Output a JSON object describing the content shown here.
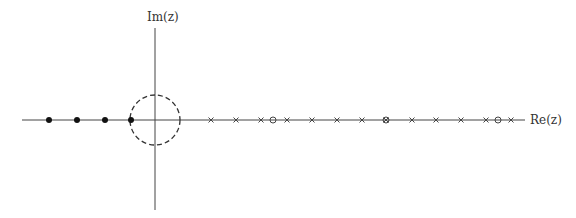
{
  "diagram": {
    "axes": {
      "x_label": "Re(z)",
      "y_label": "Im(z)",
      "origin_px": [
        155,
        120
      ],
      "x_range_px": [
        22,
        525
      ],
      "y_range_px": [
        28,
        210
      ],
      "color": "#444444"
    },
    "unit_circle": {
      "center_px": [
        155,
        120
      ],
      "radius_px": 25,
      "style": "dashed"
    },
    "filled_points": {
      "marker": "filled-dot",
      "x_px": [
        49,
        77,
        105,
        131
      ]
    },
    "poles": {
      "marker": "x",
      "x_px": [
        211,
        236,
        261,
        287,
        312,
        337,
        362,
        386,
        412,
        436,
        461,
        486,
        511
      ]
    },
    "zeros": {
      "marker": "o",
      "x_px": [
        273,
        386,
        498
      ]
    }
  }
}
